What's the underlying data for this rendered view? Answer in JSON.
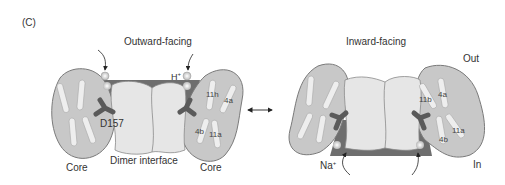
{
  "panel_label": "(C)",
  "left_state": {
    "title": "Outward-facing",
    "ion_label": "H",
    "ion_charge": "+",
    "residue_label": "D157",
    "core_left_label": "Core",
    "core_right_label": "Core",
    "interface_label": "Dimer interface",
    "helices": [
      "11h",
      "4a",
      "4b",
      "11a"
    ]
  },
  "right_state": {
    "title": "Inward-facing",
    "out_label": "Out",
    "in_label": "In",
    "ion_label": "Na",
    "ion_charge": "+",
    "helices": [
      "11b",
      "4a",
      "4b",
      "11a"
    ]
  },
  "arrow": "bidirectional",
  "colors": {
    "core_fill": "#c8c8c8",
    "core_stroke": "#7a7a7a",
    "interface_fill": "#e6e6e6",
    "dark_region": "#6e6e6e",
    "residue": "#5a5a5a",
    "ion": "#e8e8e8",
    "helix": "#eeeeee"
  }
}
